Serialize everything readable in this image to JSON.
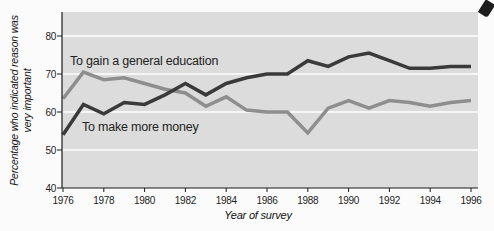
{
  "figure": {
    "y_axis_title_line1": "Percentage who indicated reason was",
    "y_axis_title_line2": "very important",
    "x_axis_title": "Year of survey"
  },
  "chart_data": {
    "type": "line",
    "title": "",
    "xlabel": "Year of survey",
    "ylabel": "Percentage who indicated reason was very important",
    "x": [
      1976,
      1977,
      1978,
      1979,
      1980,
      1981,
      1982,
      1983,
      1984,
      1985,
      1986,
      1987,
      1988,
      1989,
      1990,
      1991,
      1992,
      1993,
      1994,
      1995,
      1996
    ],
    "xticks": [
      "1976",
      "1978",
      "1980",
      "1982",
      "1984",
      "1986",
      "1988",
      "1990",
      "1992",
      "1994",
      "1996"
    ],
    "xtick_values": [
      1976,
      1978,
      1980,
      1982,
      1984,
      1986,
      1988,
      1990,
      1992,
      1994,
      1996
    ],
    "yticks": [
      "40",
      "50",
      "60",
      "70",
      "80"
    ],
    "ytick_values": [
      40,
      50,
      60,
      70,
      80
    ],
    "gridline_values": [
      50,
      60,
      70,
      80
    ],
    "ylim": [
      40,
      86
    ],
    "xlim": [
      1976,
      1996
    ],
    "grid_on": true,
    "legend_position": "inline-labels",
    "series": [
      {
        "name": "To gain a general education",
        "color": "#8e8e8e",
        "values": [
          63.5,
          70.5,
          68.5,
          69,
          67.5,
          66,
          65,
          61.5,
          64,
          60.5,
          60,
          60,
          54.5,
          61,
          63,
          61,
          63,
          62.5,
          61.5,
          62.5,
          63
        ]
      },
      {
        "name": "To make more money",
        "color": "#3a3a3a",
        "values": [
          54,
          62,
          59.5,
          62.5,
          62,
          64.5,
          67.5,
          64.5,
          67.5,
          69,
          70,
          70,
          73.5,
          72,
          74.5,
          75.5,
          73.5,
          71.5,
          71.5,
          72,
          72
        ]
      }
    ],
    "plot_bg": "#dcdcdc",
    "grid_color": "#ffffff",
    "axis_color": "#1a1a1a"
  }
}
